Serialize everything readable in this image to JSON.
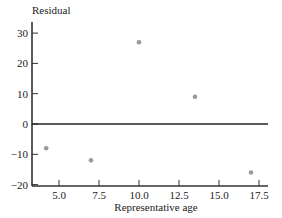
{
  "chart_data": {
    "type": "scatter",
    "title": "",
    "xlabel": "Representative age",
    "ylabel": "Residual",
    "xlim": [
      3.5,
      18.5
    ],
    "ylim": [
      -21,
      33
    ],
    "x_ticks": [
      5.0,
      7.5,
      10.0,
      12.5,
      15.0,
      17.5
    ],
    "x_tick_labels": [
      "5.0",
      "7.5",
      "10.0",
      "12.5",
      "15.0",
      "17.5"
    ],
    "y_ticks": [
      30,
      20,
      10,
      0,
      -10,
      -20
    ],
    "y_tick_labels": [
      "30",
      "20",
      "10",
      "0",
      "−10",
      "−20"
    ],
    "grid": false,
    "reference_line": {
      "y": 0
    },
    "series": [
      {
        "name": "Residuals",
        "color": "#9a9a9a",
        "points": [
          {
            "x": 4.2,
            "y": -8
          },
          {
            "x": 7.0,
            "y": -12
          },
          {
            "x": 10.0,
            "y": 27
          },
          {
            "x": 13.5,
            "y": 9
          },
          {
            "x": 17.0,
            "y": -16
          }
        ]
      }
    ]
  }
}
